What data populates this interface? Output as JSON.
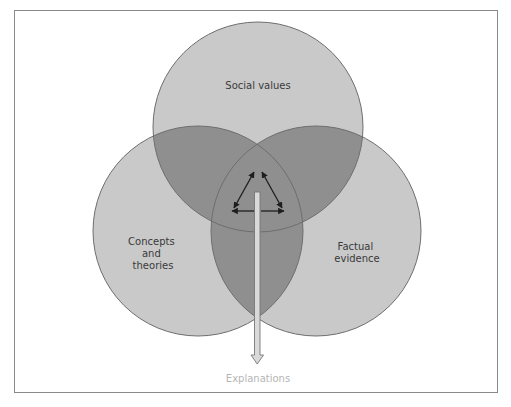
{
  "diagram": {
    "type": "venn",
    "circles": [
      {
        "id": "social",
        "label_lines": [
          "Social values"
        ],
        "cx": 258,
        "cy": 127,
        "r": 105
      },
      {
        "id": "concepts",
        "label_lines": [
          "Concepts",
          "and",
          "theories"
        ],
        "cx": 198,
        "cy": 231,
        "r": 105
      },
      {
        "id": "factual",
        "label_lines": [
          "Factual",
          "evidence"
        ],
        "cx": 316,
        "cy": 231,
        "r": 105
      }
    ],
    "output": {
      "label": "Explanations"
    },
    "colors": {
      "circle_fill": "#c9c9c9",
      "overlap_fill": "#8f8f8f",
      "circle_stroke": "#6e6e6e",
      "frame": "#8a8a8a",
      "arrow_shaft": "#d9d9d9",
      "arrow_outline": "#777777",
      "text": "#3a3a3a",
      "output_text": "#b5b5b5"
    }
  }
}
